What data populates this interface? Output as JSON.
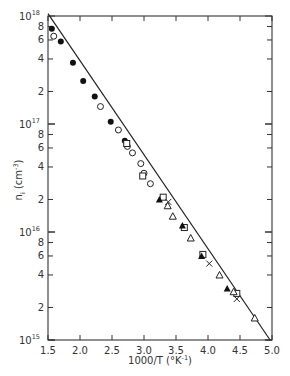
{
  "chart_data": {
    "type": "scatter",
    "title": "",
    "xlabel": "1000/T (°K⁻¹)",
    "ylabel": "nᵢ (cm⁻³)",
    "xscale": "linear",
    "yscale": "log",
    "xlim": [
      1.5,
      5.0
    ],
    "ylim": [
      1000000000000000.0,
      1e+18
    ],
    "grid": false,
    "legend": "none",
    "x_ticks": [
      "1.5",
      "2.0",
      "2.5",
      "3.0",
      "3.5",
      "4.0",
      "4.5",
      "5.0"
    ],
    "y_ticks_major": [
      {
        "base": "10",
        "exp": "18",
        "value": 1e+18
      },
      {
        "base": "10",
        "exp": "17",
        "value": 1e+17
      },
      {
        "base": "10",
        "exp": "16",
        "value": 1e+16
      },
      {
        "base": "10",
        "exp": "15",
        "value": 1000000000000000.0
      }
    ],
    "y_ticks_minor_labels": [
      "8",
      "6",
      "4",
      "2"
    ],
    "fit_line": {
      "x": [
        1.5,
        4.97
      ],
      "y": [
        1.05e+18,
        1000000000000000.0
      ]
    },
    "series": [
      {
        "name": "filled circles",
        "marker": "filled-circle",
        "x": [
          1.56,
          1.7,
          1.89,
          2.05,
          2.23,
          2.48,
          2.7
        ],
        "y": [
          7.6e+17,
          5.8e+17,
          3.7e+17,
          2.5e+17,
          1.8e+17,
          1.05e+17,
          7e+16
        ]
      },
      {
        "name": "open circles",
        "marker": "open-circle",
        "x": [
          1.59,
          2.32,
          2.6,
          2.74,
          2.82,
          2.95,
          3.0,
          3.1
        ],
        "y": [
          6.5e+17,
          1.45e+17,
          8.8e+16,
          6.2e+16,
          5.4e+16,
          4.3e+16,
          3.5e+16,
          2.8e+16
        ]
      },
      {
        "name": "open squares",
        "marker": "open-square",
        "x": [
          2.73,
          2.98,
          3.3,
          3.63,
          3.92,
          4.45
        ],
        "y": [
          6.6e+16,
          3.3e+16,
          2.1e+16,
          1.1e+16,
          6200000000000000.0,
          2700000000000000.0
        ]
      },
      {
        "name": "filled triangles",
        "marker": "filled-triangle",
        "x": [
          3.24,
          3.6,
          3.9,
          4.3
        ],
        "y": [
          2e+16,
          1.15e+16,
          6000000000000000.0,
          3000000000000000.0
        ]
      },
      {
        "name": "open triangles",
        "marker": "open-triangle",
        "x": [
          3.37,
          3.45,
          3.73,
          4.18,
          4.4,
          4.73
        ],
        "y": [
          1.75e+16,
          1.4e+16,
          8800000000000000.0,
          4000000000000000.0,
          2800000000000000.0,
          1600000000000000.0
        ]
      },
      {
        "name": "crosses",
        "marker": "cross",
        "x": [
          3.38,
          4.02,
          4.45
        ],
        "y": [
          1.9e+16,
          5100000000000000.0,
          2400000000000000.0
        ]
      }
    ]
  },
  "labels": {
    "x_axis_title": "1000/T (°K",
    "x_axis_title_exp": "-1",
    "x_axis_title_close": ")",
    "y_axis_title_main": "n",
    "y_axis_title_sub": "i",
    "y_axis_title_unit": " (cm",
    "y_axis_title_exp": "-3",
    "y_axis_title_close": ")"
  }
}
